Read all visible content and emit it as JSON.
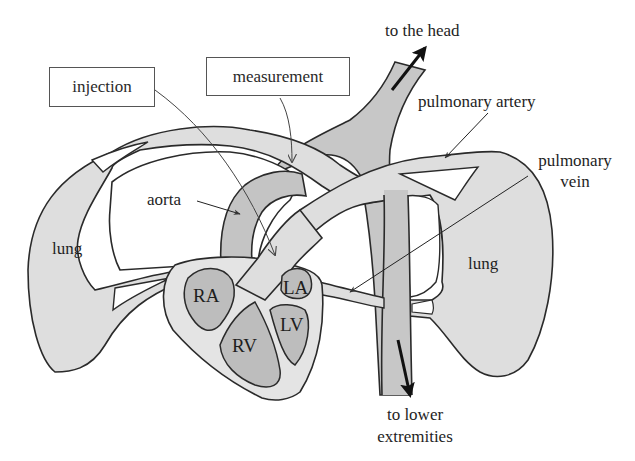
{
  "diagram": {
    "type": "anatomical-schematic",
    "colors": {
      "background": "#ffffff",
      "light_tissue": "#dedede",
      "dark_vessel": "#c4c4c4",
      "chamber_fill": "#bdbdbd",
      "outline": "#2a2a2a"
    },
    "boxes": {
      "injection": "injection",
      "measurement": "measurement"
    },
    "labels": {
      "to_head": "to the head",
      "pulmonary_artery": "pulmonary artery",
      "pulmonary_vein_line1": "pulmonary",
      "pulmonary_vein_line2": "vein",
      "aorta": "aorta",
      "lung_left": "lung",
      "lung_right": "lung",
      "to_lower_line1": "to lower",
      "to_lower_line2": "extremities"
    },
    "chambers": {
      "ra": "RA",
      "rv": "RV",
      "la": "LA",
      "lv": "LV"
    }
  }
}
